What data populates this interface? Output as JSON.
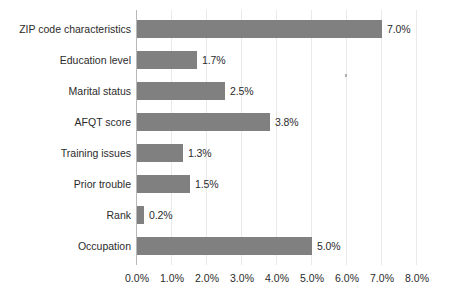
{
  "chart_data": {
    "type": "bar",
    "orientation": "horizontal",
    "title": "",
    "xlabel": "",
    "ylabel": "",
    "categories": [
      "ZIP code characteristics",
      "Education level",
      "Marital status",
      "AFQT score",
      "Training issues",
      "Prior trouble",
      "Rank",
      "Occupation"
    ],
    "values": [
      7.0,
      1.7,
      2.5,
      3.8,
      1.3,
      1.5,
      0.2,
      5.0
    ],
    "value_labels": [
      "7.0%",
      "1.7%",
      "2.5%",
      "3.8%",
      "1.3%",
      "1.5%",
      "0.2%",
      "5.0%"
    ],
    "xlim": [
      0,
      8
    ],
    "xtick_values": [
      0,
      1,
      2,
      3,
      4,
      5,
      6,
      7,
      8
    ],
    "xtick_labels": [
      "0.0%",
      "1.0%",
      "2.0%",
      "3.0%",
      "4.0%",
      "5.0%",
      "6.0%",
      "7.0%",
      "8.0%"
    ],
    "grid": "vertical",
    "legend": "none",
    "bar_color": "#808080",
    "gridline_color": "#e9e9e9",
    "axis_color": "#b8b8b8",
    "text_color": "#2b2b2b"
  }
}
